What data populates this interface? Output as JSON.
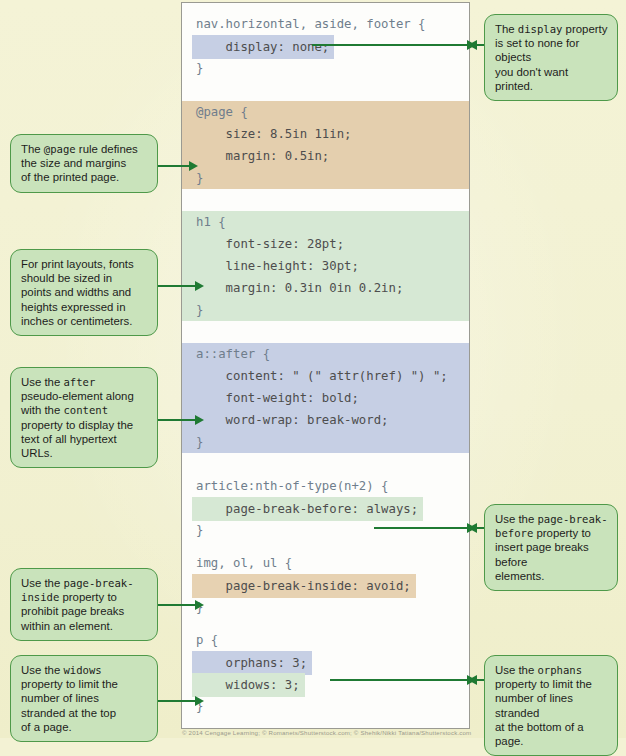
{
  "code_panel": {
    "rules": [
      {
        "id": "rule-display-none",
        "highlight": "none",
        "lines": [
          {
            "text": "nav.horizontal, aside, footer {",
            "style": "selector"
          },
          {
            "text": "    display: none;",
            "style": "blue"
          },
          {
            "text": "}",
            "style": "selector"
          }
        ]
      },
      {
        "id": "rule-page",
        "highlight": "tan-block",
        "lines": [
          {
            "text": "@page {",
            "style": "selector"
          },
          {
            "text": "    size: 8.5in 11in;",
            "style": "plain"
          },
          {
            "text": "    margin: 0.5in;",
            "style": "plain"
          },
          {
            "text": "}",
            "style": "selector"
          }
        ]
      },
      {
        "id": "rule-h1",
        "highlight": "green-block",
        "lines": [
          {
            "text": "h1 {",
            "style": "selector"
          },
          {
            "text": "    font-size: 28pt;",
            "style": "green"
          },
          {
            "text": "    line-height: 30pt;",
            "style": "green"
          },
          {
            "text": "    margin: 0.3in 0in 0.2in;",
            "style": "green"
          },
          {
            "text": "}",
            "style": "selector"
          }
        ]
      },
      {
        "id": "rule-a-after",
        "highlight": "blue-block",
        "lines": [
          {
            "text": "a::after {",
            "style": "selector"
          },
          {
            "text": "    content: \" (\" attr(href) \") \";",
            "style": "plain"
          },
          {
            "text": "    font-weight: bold;",
            "style": "plain"
          },
          {
            "text": "    word-wrap: break-word;",
            "style": "plain"
          },
          {
            "text": "}",
            "style": "selector"
          }
        ]
      },
      {
        "id": "rule-article-nth",
        "highlight": "none",
        "lines": [
          {
            "text": "article:nth-of-type(n+2) {",
            "style": "selector"
          },
          {
            "text": "    page-break-before: always;",
            "style": "green"
          },
          {
            "text": "}",
            "style": "selector"
          }
        ]
      },
      {
        "id": "rule-img-ol-ul",
        "highlight": "none",
        "lines": [
          {
            "text": "img, ol, ul {",
            "style": "selector"
          },
          {
            "text": "    page-break-inside: avoid;",
            "style": "tan"
          },
          {
            "text": "}",
            "style": "selector"
          }
        ]
      },
      {
        "id": "rule-p",
        "highlight": "none",
        "lines": [
          {
            "text": "p {",
            "style": "selector"
          },
          {
            "text": "    orphans: 3;",
            "style": "blue"
          },
          {
            "text": "    widows: 3;",
            "style": "green"
          },
          {
            "text": "}",
            "style": "selector"
          }
        ]
      }
    ]
  },
  "callouts": {
    "display_none": {
      "lines": [
        [
          {
            "t": "The ",
            "m": false
          },
          {
            "t": "display",
            "m": true
          },
          {
            "t": " property",
            "m": false
          }
        ],
        [
          {
            "t": "is set to none for objects",
            "m": false
          }
        ],
        [
          {
            "t": "you don't want printed.",
            "m": false
          }
        ]
      ]
    },
    "page_rule": {
      "lines": [
        [
          {
            "t": "The ",
            "m": false
          },
          {
            "t": "@page",
            "m": true
          },
          {
            "t": " rule defines",
            "m": false
          }
        ],
        [
          {
            "t": "the size and margins",
            "m": false
          }
        ],
        [
          {
            "t": "of the printed page.",
            "m": false
          }
        ]
      ]
    },
    "print_fonts": {
      "lines": [
        [
          {
            "t": "For print layouts, fonts",
            "m": false
          }
        ],
        [
          {
            "t": "should be sized in",
            "m": false
          }
        ],
        [
          {
            "t": "points and widths and",
            "m": false
          }
        ],
        [
          {
            "t": "heights expressed in",
            "m": false
          }
        ],
        [
          {
            "t": "inches or centimeters.",
            "m": false
          }
        ]
      ]
    },
    "after_pseudo": {
      "lines": [
        [
          {
            "t": "Use the ",
            "m": false
          },
          {
            "t": "after",
            "m": true
          }
        ],
        [
          {
            "t": "pseudo-element along",
            "m": false
          }
        ],
        [
          {
            "t": "with the ",
            "m": false
          },
          {
            "t": "content",
            "m": true
          }
        ],
        [
          {
            "t": "property to display the",
            "m": false
          }
        ],
        [
          {
            "t": "text of all hypertext",
            "m": false
          }
        ],
        [
          {
            "t": "URLs.",
            "m": false
          }
        ]
      ]
    },
    "page_break_before": {
      "lines": [
        [
          {
            "t": "Use the ",
            "m": false
          },
          {
            "t": "page-break-",
            "m": true
          }
        ],
        [
          {
            "t": "before",
            "m": true
          },
          {
            "t": " property to",
            "m": false
          }
        ],
        [
          {
            "t": "insert page breaks before",
            "m": false
          }
        ],
        [
          {
            "t": "elements.",
            "m": false
          }
        ]
      ]
    },
    "page_break_inside": {
      "lines": [
        [
          {
            "t": "Use the ",
            "m": false
          },
          {
            "t": "page-break-",
            "m": true
          }
        ],
        [
          {
            "t": "inside",
            "m": true
          },
          {
            "t": " property to",
            "m": false
          }
        ],
        [
          {
            "t": "prohibit page breaks",
            "m": false
          }
        ],
        [
          {
            "t": "within an element.",
            "m": false
          }
        ]
      ]
    },
    "widows": {
      "lines": [
        [
          {
            "t": "Use the ",
            "m": false
          },
          {
            "t": "widows",
            "m": true
          }
        ],
        [
          {
            "t": "property to limit the",
            "m": false
          }
        ],
        [
          {
            "t": "number of lines",
            "m": false
          }
        ],
        [
          {
            "t": "stranded at the top",
            "m": false
          }
        ],
        [
          {
            "t": "of a page.",
            "m": false
          }
        ]
      ]
    },
    "orphans": {
      "lines": [
        [
          {
            "t": "Use the ",
            "m": false
          },
          {
            "t": "orphans",
            "m": true
          }
        ],
        [
          {
            "t": "property to limit the",
            "m": false
          }
        ],
        [
          {
            "t": "number of lines stranded",
            "m": false
          }
        ],
        [
          {
            "t": "at the bottom of a page.",
            "m": false
          }
        ]
      ]
    }
  },
  "footer": {
    "credit": "© 2014 Cengage Learning; © Romanets/Shutterstock.com; © Shehik/Nikki Tatiana/Shutterstock.com"
  },
  "colors": {
    "page_background": "#f3f2d4",
    "callout_fill": "#c9e3bb",
    "callout_border": "#4e9949",
    "arrow": "#1f7a33",
    "highlight_blue": "#c6cfe4",
    "highlight_tan": "#e7d2b2",
    "highlight_green": "#d6e8d4",
    "code_text": "#4d4d4d",
    "selector_text": "#6f7d8c"
  }
}
